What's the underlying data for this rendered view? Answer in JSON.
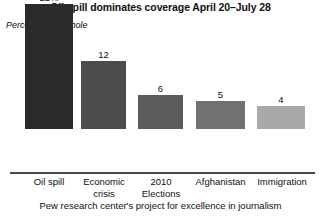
{
  "chart_data": {
    "type": "bar",
    "title": "Oil spill dominates coverage April 20–July 28",
    "ylabel": "Percent of newshole",
    "xlabel": "",
    "source": "Pew research center's project for excellence in journalism",
    "categories": [
      "Oil spill",
      "Economic crisis",
      "2010 Elections",
      "Afghanistan",
      "Immigration"
    ],
    "category_lines": [
      [
        "Oil spill"
      ],
      [
        "Economic",
        "crisis"
      ],
      [
        "2010",
        "Elections"
      ],
      [
        "Afghanistan"
      ],
      [
        "Immigration"
      ]
    ],
    "values": [
      22,
      12,
      6,
      5,
      4
    ],
    "value_labels": [
      "22%",
      "12",
      "6",
      "5",
      "4"
    ],
    "bar_colors": [
      "#2b2b2b",
      "#4c4c4c",
      "#5c5c5c",
      "#717171",
      "#a9a9a9"
    ],
    "ylim": [
      0,
      22
    ],
    "grid": false,
    "legend": null,
    "axis_color": "#4a4a4a"
  },
  "layout": {
    "bars": [
      {
        "left": 25,
        "width": 48
      },
      {
        "left": 81,
        "width": 45
      },
      {
        "left": 138,
        "width": 45
      },
      {
        "left": 196,
        "width": 49
      },
      {
        "left": 257,
        "width": 48
      }
    ],
    "ticks": [
      {
        "left": 13,
        "width": 72
      },
      {
        "left": 70,
        "width": 68
      },
      {
        "left": 128,
        "width": 66
      },
      {
        "left": 182,
        "width": 77
      },
      {
        "left": 247,
        "width": 70
      }
    ]
  }
}
